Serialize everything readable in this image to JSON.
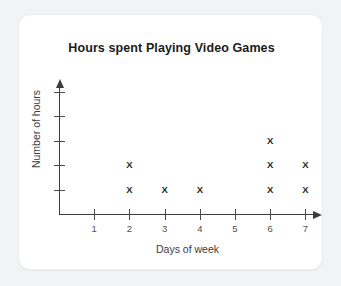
{
  "card": {
    "background": "#ffffff",
    "border_color": "#ebecec"
  },
  "chart_data": {
    "type": "scatter",
    "plot_style": "dot-plot",
    "title": "Hours spent Playing Video Games",
    "xlabel": "Days of week",
    "ylabel": "Number of hours",
    "marker": "X",
    "categories": [
      "1",
      "2",
      "3",
      "4",
      "5",
      "6",
      "7"
    ],
    "x": [
      1,
      2,
      3,
      4,
      5,
      6,
      7
    ],
    "values": [
      0,
      2,
      1,
      1,
      0,
      3,
      2
    ],
    "xlim": [
      0,
      7.8
    ],
    "ylim": [
      0,
      5
    ],
    "x_tick_labels": [
      "1",
      "2",
      "3",
      "4",
      "5",
      "6",
      "7"
    ],
    "y_tick_labels": [
      "",
      "",
      "",
      "",
      ""
    ],
    "y_tick_count": 5,
    "grid": false,
    "legend": null,
    "axis_arrows": {
      "x": "right",
      "y": "up"
    },
    "points": [
      {
        "day": 2,
        "level": 1
      },
      {
        "day": 2,
        "level": 2
      },
      {
        "day": 3,
        "level": 1
      },
      {
        "day": 4,
        "level": 1
      },
      {
        "day": 6,
        "level": 1
      },
      {
        "day": 6,
        "level": 2
      },
      {
        "day": 6,
        "level": 3
      },
      {
        "day": 7,
        "level": 1
      },
      {
        "day": 7,
        "level": 2
      }
    ],
    "colors": {
      "axis": "#3c3c3c",
      "marker": "#1f1f1f",
      "title": "#1b1b1b",
      "label": "#3d3d3d",
      "tick_label": "#4f4f4f"
    }
  }
}
